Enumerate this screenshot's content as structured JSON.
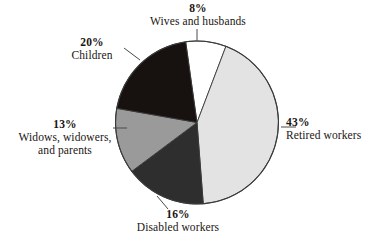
{
  "chart_data": {
    "type": "pie",
    "title": "",
    "xlabel": "",
    "ylabel": "",
    "legend_position": "outside-labels",
    "grid": false,
    "units": "percent",
    "start_angle_deg": -98,
    "direction": "clockwise",
    "categories": [
      "Wives and husbands",
      "Retired workers",
      "Disabled workers",
      "Widows, widowers, and parents",
      "Children"
    ],
    "values": [
      8,
      43,
      16,
      13,
      20
    ],
    "colors": [
      "#ffffff",
      "#e3e3e3",
      "#2e2e2e",
      "#9a9a9a",
      "#17120f"
    ],
    "slices": [
      {
        "label": "Wives and husbands",
        "value": 8,
        "percent_text": "8%",
        "color": "#ffffff"
      },
      {
        "label": "Retired workers",
        "value": 43,
        "percent_text": "43%",
        "color": "#e3e3e3"
      },
      {
        "label": "Disabled workers",
        "value": 16,
        "percent_text": "16%",
        "color": "#2e2e2e"
      },
      {
        "label": "Widows, widowers, and parents",
        "value": 13,
        "percent_text": "13%",
        "color": "#9a9a9a"
      },
      {
        "label": "Children",
        "value": 20,
        "percent_text": "20%",
        "color": "#17120f"
      }
    ]
  },
  "labels": {
    "wives": {
      "pct": "8%",
      "name": "Wives and husbands"
    },
    "retired": {
      "pct": "43%",
      "name": "Retired workers"
    },
    "disabled": {
      "pct": "16%",
      "name": "Disabled workers"
    },
    "widows": {
      "pct": "13%",
      "name": "Widows, widowers,",
      "name2": "and parents"
    },
    "children": {
      "pct": "20%",
      "name": "Children"
    }
  },
  "style": {
    "outline_color": "#3a3a3a",
    "leader_color": "#4a4a4a",
    "background": "#ffffff"
  }
}
